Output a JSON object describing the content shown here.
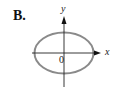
{
  "figure": {
    "option_label": "B.",
    "x_axis_label": "x",
    "y_axis_label": "y",
    "origin_label": "0",
    "curve": {
      "type": "ellipse",
      "center": [
        64,
        53
      ],
      "rx": 29.5,
      "ry": 20.5,
      "stroke_color": "#8a8a8a"
    },
    "axis_color": "#222222"
  }
}
